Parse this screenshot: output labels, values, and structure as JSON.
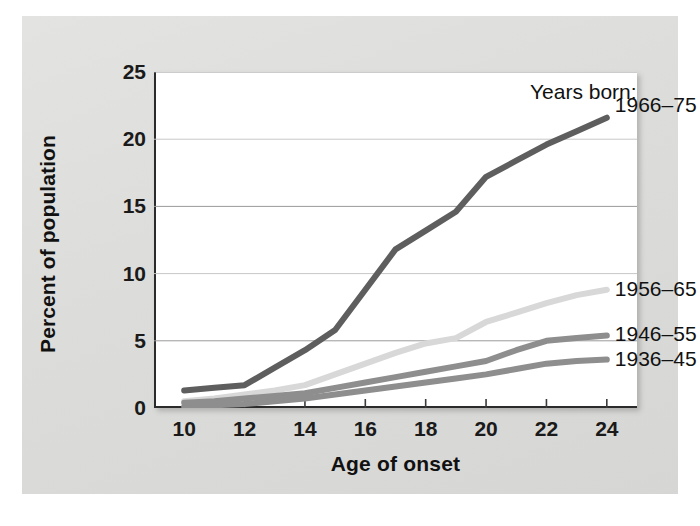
{
  "figure": {
    "background": "#dededc",
    "plot_background": "#ffffff",
    "axis_color": "#2b2b2b"
  },
  "legend": {
    "title": "Years born:"
  },
  "chart_data": {
    "type": "line",
    "title": "",
    "subtitle": "",
    "xlabel": "Age of onset",
    "ylabel": "Percent of population",
    "xlim": [
      9,
      25
    ],
    "ylim": [
      0,
      25
    ],
    "xticks": [
      10,
      12,
      14,
      16,
      18,
      20,
      22,
      24
    ],
    "xtick_labels": [
      "10",
      "12",
      "14",
      "16",
      "18",
      "20",
      "22",
      "24"
    ],
    "yticks": [
      0,
      5,
      10,
      15,
      20,
      25
    ],
    "ytick_labels": [
      "0",
      "5",
      "10",
      "15",
      "20",
      "25"
    ],
    "grid": "horizontal",
    "legend_position": "right-inline",
    "legend_title": "Years born:",
    "x": [
      10,
      11,
      12,
      13,
      14,
      15,
      16,
      17,
      18,
      19,
      20,
      21,
      22,
      23,
      24
    ],
    "series": [
      {
        "name": "1966-75",
        "label": "1966–75",
        "color": "#5e5e5e",
        "values": [
          1.3,
          1.5,
          1.7,
          3.0,
          4.3,
          5.8,
          8.8,
          11.8,
          13.2,
          14.6,
          17.2,
          18.4,
          19.6,
          20.6,
          21.6
        ]
      },
      {
        "name": "1956-65",
        "label": "1956–65",
        "color": "#d8d8d8",
        "values": [
          0.5,
          0.7,
          1.0,
          1.3,
          1.7,
          2.5,
          3.3,
          4.1,
          4.8,
          5.2,
          6.4,
          7.1,
          7.8,
          8.4,
          8.8
        ]
      },
      {
        "name": "1946-55",
        "label": "1946–55",
        "color": "#8e8e8e",
        "values": [
          0.4,
          0.5,
          0.7,
          0.9,
          1.1,
          1.5,
          1.9,
          2.3,
          2.7,
          3.1,
          3.5,
          4.3,
          5.0,
          5.2,
          5.4
        ]
      },
      {
        "name": "1936-45",
        "label": "1936–45",
        "color": "#8e8e8e",
        "values": [
          0.1,
          0.2,
          0.3,
          0.5,
          0.7,
          1.0,
          1.3,
          1.6,
          1.9,
          2.2,
          2.5,
          2.9,
          3.3,
          3.5,
          3.6
        ]
      }
    ]
  }
}
